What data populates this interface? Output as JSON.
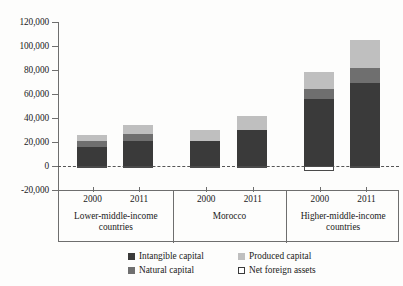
{
  "chart_data": {
    "type": "bar",
    "subtype": "stacked",
    "title": "",
    "xlabel": "",
    "ylabel": "",
    "ylim": [
      -20000,
      120000
    ],
    "ytick_labels": [
      "120,000",
      "100,000",
      "80,000",
      "60,000",
      "40,000",
      "20,000",
      "0",
      "-20,000"
    ],
    "ytick_values": [
      120000,
      100000,
      80000,
      60000,
      40000,
      20000,
      0,
      -20000
    ],
    "grid": false,
    "zero_line": true,
    "legend_position": "bottom",
    "groups": [
      {
        "label": "Lower-middle-income countries",
        "label_lines": [
          "Lower-middle-income",
          "countries"
        ]
      },
      {
        "label": "Morocco",
        "label_lines": [
          "Morocco"
        ]
      },
      {
        "label": "Higher-middle-income countries",
        "label_lines": [
          "Higher-middle-income",
          "countries"
        ]
      }
    ],
    "categories": [
      "2000",
      "2011",
      "2000",
      "2011",
      "2000",
      "2011"
    ],
    "series": [
      {
        "name": "Intangible capital",
        "color": "#3a3a3a",
        "values": [
          16000,
          21000,
          21000,
          30000,
          56000,
          69000
        ]
      },
      {
        "name": "Natural capital",
        "color": "#6f6f6f",
        "values": [
          5000,
          6000,
          0,
          0,
          8000,
          13000
        ]
      },
      {
        "name": "Produced capital",
        "color": "#bfbfbf",
        "values": [
          5000,
          7000,
          9000,
          12000,
          14000,
          23000
        ]
      },
      {
        "name": "Net foreign assets",
        "color": "#ffffff",
        "values": [
          -900,
          -900,
          -900,
          -900,
          -4000,
          -1500
        ]
      }
    ],
    "totals": [
      26000,
      34000,
      30000,
      42000,
      78000,
      105000
    ]
  },
  "legend": {
    "items": [
      {
        "label": "Intangible capital",
        "swatch": "swatch-intangible-capital"
      },
      {
        "label": "Produced capital",
        "swatch": "swatch-produced-capital"
      },
      {
        "label": "Natural capital",
        "swatch": "swatch-natural-capital"
      },
      {
        "label": "Net foreign assets",
        "swatch": "swatch-net-foreign-assets"
      }
    ]
  }
}
